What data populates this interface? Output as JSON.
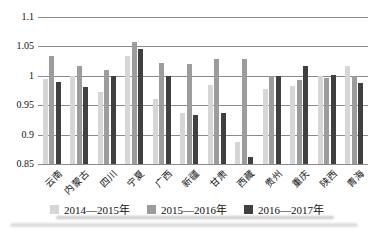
{
  "chart_data": {
    "type": "bar",
    "title": "",
    "xlabel": "",
    "ylabel": "",
    "categories": [
      "云南",
      "内蒙古",
      "四川",
      "宁夏",
      "广西",
      "新疆",
      "甘肃",
      "西藏",
      "贵州",
      "重庆",
      "陕西",
      "青海"
    ],
    "series": [
      {
        "name": "2014—2015年",
        "color": "#d6d6d6",
        "values": [
          0.995,
          1.0,
          0.973,
          1.034,
          0.961,
          0.937,
          0.985,
          0.888,
          0.978,
          0.982,
          1.0,
          1.017
        ]
      },
      {
        "name": "2015—2016年",
        "color": "#9c9c9c",
        "values": [
          1.033,
          1.016,
          1.01,
          1.058,
          1.022,
          1.021,
          1.028,
          1.028,
          1.0,
          0.993,
          0.997,
          1.0
        ]
      },
      {
        "name": "2016—2017年",
        "color": "#404040",
        "values": [
          0.99,
          0.981,
          1.0,
          1.045,
          1.0,
          0.933,
          0.937,
          0.862,
          1.0,
          1.017,
          1.001,
          0.988
        ]
      }
    ],
    "ylim": [
      0.85,
      1.1
    ],
    "ytick_step": 0.05,
    "ytick_labels": [
      "0.85",
      "0.9",
      "0.95",
      "1",
      "1.05",
      "1.1"
    ],
    "grid": "horizontal",
    "gridline_color": "#8a8a8a",
    "legend_position": "bottom"
  }
}
